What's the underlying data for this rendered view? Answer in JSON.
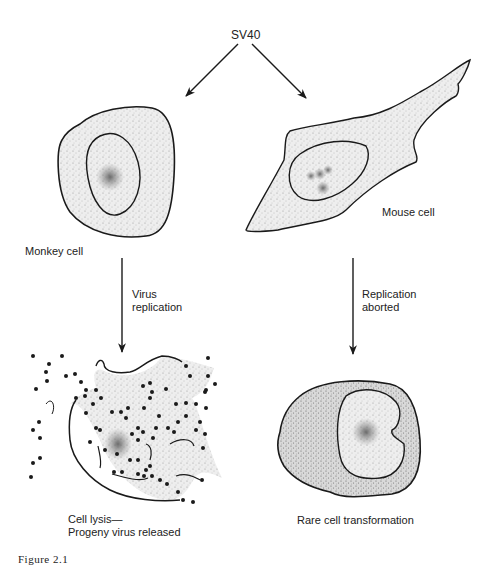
{
  "figure": {
    "source_label": "SV40",
    "caption": "Figure 2.1",
    "branches": [
      {
        "host": "Monkey cell",
        "process": [
          "Virus",
          "replication"
        ],
        "outcome": [
          "Cell lysis—",
          "Progeny virus released"
        ]
      },
      {
        "host": "Mouse cell",
        "process": [
          "Replication",
          "aborted"
        ],
        "outcome": [
          "Rare cell transformation"
        ]
      }
    ],
    "colors": {
      "ink": "#1a1a1a",
      "stipple_light": "#e6e6e6",
      "stipple_dark": "#bdbdbd",
      "background": "#ffffff"
    }
  }
}
